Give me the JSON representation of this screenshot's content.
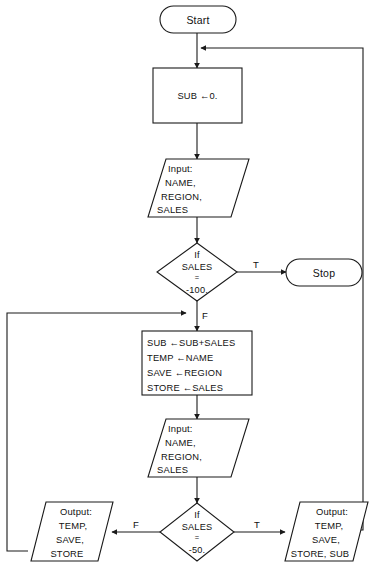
{
  "diagram": {
    "colors": {
      "background": "#ffffff",
      "stroke": "#1a1a1a",
      "text": "#111111"
    },
    "nodes": {
      "start": {
        "label": "Start",
        "type": "terminator"
      },
      "stop": {
        "label": "Stop",
        "type": "terminator"
      },
      "init_sub": {
        "type": "process",
        "lines": [
          "SUB ←0."
        ]
      },
      "input_first": {
        "type": "input",
        "lines": [
          "Input:",
          "NAME,",
          "REGION,",
          "SALES"
        ]
      },
      "decision_first": {
        "type": "decision",
        "lines": [
          "If",
          "SALES",
          "=",
          "-100."
        ]
      },
      "accumulate": {
        "type": "process",
        "lines": [
          "SUB ←SUB+SALES",
          "TEMP ←NAME",
          "SAVE ←REGION",
          "STORE ←SALES"
        ]
      },
      "input_second": {
        "type": "input",
        "lines": [
          "Input:",
          "NAME,",
          "REGION,",
          "SALES"
        ]
      },
      "decision_second": {
        "type": "decision",
        "lines": [
          "If",
          "SALES",
          "=",
          "-50."
        ]
      },
      "output_left": {
        "type": "output",
        "lines": [
          "Output:",
          "TEMP,",
          "SAVE,",
          "STORE"
        ]
      },
      "output_right": {
        "type": "output",
        "lines": [
          "Output:",
          "TEMP,",
          "SAVE,",
          "STORE, SUB"
        ]
      }
    },
    "branch_labels": {
      "first_true": "T",
      "first_false": "F",
      "second_true": "T",
      "second_false": "F"
    }
  }
}
